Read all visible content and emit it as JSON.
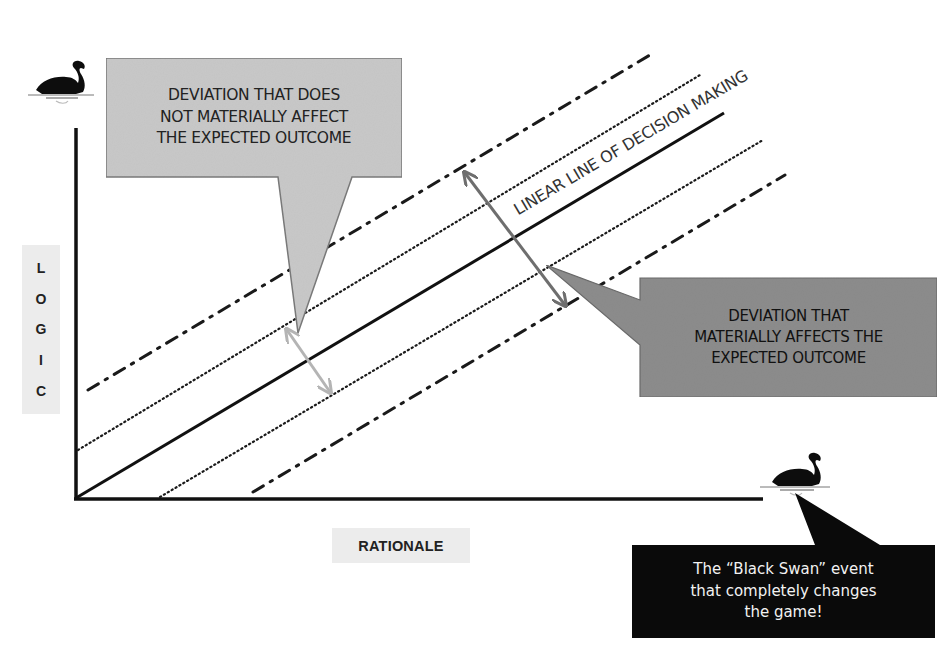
{
  "diagram": {
    "axes": {
      "y_label": "LOGIC",
      "y_label_letters": [
        "L",
        "O",
        "G",
        "I",
        "C"
      ],
      "x_label": "RATIONALE"
    },
    "main_line_label": "LINEAR LINE OF DECISION MAKING",
    "lines": [
      {
        "id": "upper-dashdot",
        "style": "dash-dot",
        "from": [
          88,
          390
        ],
        "to": [
          655,
          52
        ]
      },
      {
        "id": "upper-dotted",
        "style": "dotted",
        "from": [
          78,
          450
        ],
        "to": [
          700,
          75
        ]
      },
      {
        "id": "decision-line",
        "style": "solid",
        "from": [
          76,
          498
        ],
        "to": [
          724,
          113
        ]
      },
      {
        "id": "lower-dotted",
        "style": "dotted",
        "from": [
          160,
          497
        ],
        "to": [
          763,
          140
        ]
      },
      {
        "id": "lower-dashdot",
        "style": "dash-dot",
        "from": [
          253,
          492
        ],
        "to": [
          785,
          175
        ]
      }
    ],
    "callouts": [
      {
        "id": "minor-deviation",
        "lines": [
          "DEVIATION THAT DOES",
          "NOT MATERIALLY AFFECT",
          "THE EXPECTED OUTCOME"
        ],
        "fill": "#c8c8c8"
      },
      {
        "id": "major-deviation",
        "lines": [
          "DEVIATION THAT",
          "MATERIALLY AFFECTS THE",
          "EXPECTED OUTCOME"
        ],
        "fill": "#8c8c8c"
      },
      {
        "id": "black-swan",
        "lines": [
          "The “Black Swan” event",
          "that completely changes",
          "the game!"
        ],
        "fill": "#0a0a0a"
      }
    ],
    "arrows": [
      {
        "id": "minor-deviation-arrow",
        "color": "#b4b4b4",
        "from": [
          287,
          330
        ],
        "to": [
          330,
          392
        ]
      },
      {
        "id": "major-deviation-arrow",
        "color": "#6e6e6e",
        "from": [
          465,
          173
        ],
        "to": [
          565,
          305
        ]
      }
    ],
    "icons": {
      "top_swan": "black-swan-icon",
      "bottom_swan": "black-swan-icon"
    },
    "colors": {
      "axis": "#111111",
      "light_callout": "#c8c8c8",
      "dark_callout": "#8c8c8c",
      "black_callout": "#0a0a0a",
      "label_bg": "#ececec"
    }
  }
}
